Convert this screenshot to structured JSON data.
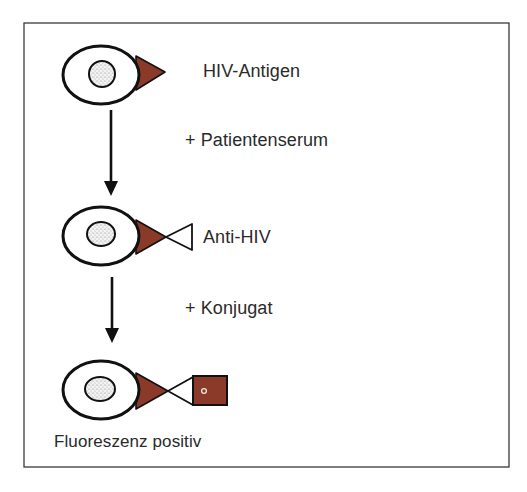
{
  "figure": {
    "frame": {
      "x": 24,
      "y": 23,
      "width": 485,
      "height": 444,
      "stroke": "#3a3a3a"
    },
    "colors": {
      "antigen_fill": "#8B3A2A",
      "outline": "#111111",
      "nucleus_fill": "#e8e8e8",
      "text": "#2a2a2a",
      "background": "#ffffff"
    },
    "steps": [
      {
        "label": "HIV-Antigen",
        "components": [
          "cell",
          "nucleus",
          "hiv-antigen"
        ]
      },
      {
        "label": "Anti-HIV",
        "components": [
          "cell",
          "nucleus",
          "hiv-antigen",
          "anti-hiv-antibody"
        ]
      },
      {
        "label": "Fluoreszenz positiv",
        "components": [
          "cell",
          "nucleus",
          "hiv-antigen",
          "anti-hiv-antibody",
          "fluorescent-conjugate"
        ]
      }
    ],
    "transitions": [
      {
        "label": "+ Patientenserum",
        "icon": "arrow-down-icon"
      },
      {
        "label": "+ Konjugat",
        "icon": "arrow-down-icon"
      }
    ]
  }
}
